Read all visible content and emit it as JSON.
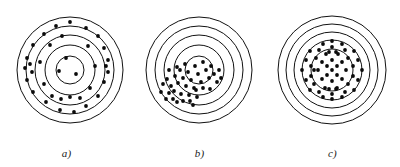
{
  "figure": {
    "background_color": "#ffffff",
    "ink_color": "#111111",
    "shot_color": "#0a0a0a",
    "panel_count": 3
  },
  "chart_data": {
    "type": "scatter",
    "title": "",
    "xlabel": "",
    "ylabel": "",
    "panels": [
      {
        "caption": "a)",
        "center": [
          70,
          70
        ],
        "ring_radii": [
          53,
          44,
          35,
          25,
          14
        ],
        "ring_count": 5,
        "pattern": "scattered",
        "shot_radius": 1.9,
        "shot_count": 36,
        "shots": [
          [
            70,
            22
          ],
          [
            56,
            26
          ],
          [
            86,
            28
          ],
          [
            44,
            34
          ],
          [
            98,
            36
          ],
          [
            33,
            45
          ],
          [
            104,
            48
          ],
          [
            27,
            58
          ],
          [
            108,
            60
          ],
          [
            25,
            68
          ],
          [
            108,
            72
          ],
          [
            27,
            80
          ],
          [
            104,
            82
          ],
          [
            33,
            92
          ],
          [
            98,
            96
          ],
          [
            46,
            102
          ],
          [
            86,
            106
          ],
          [
            60,
            110
          ],
          [
            74,
            112
          ],
          [
            50,
            45
          ],
          [
            88,
            46
          ],
          [
            40,
            62
          ],
          [
            95,
            66
          ],
          [
            44,
            84
          ],
          [
            90,
            88
          ],
          [
            62,
            36
          ],
          [
            80,
            98
          ],
          [
            66,
            58
          ],
          [
            76,
            74
          ],
          [
            59,
            71
          ],
          [
            30,
            64
          ],
          [
            32,
            72
          ],
          [
            106,
            66
          ],
          [
            52,
            96
          ],
          [
            61,
            99
          ],
          [
            70,
            97
          ]
        ]
      },
      {
        "caption": "b)",
        "center": [
          66,
          70
        ],
        "ring_radii": [
          53,
          44,
          35,
          25,
          14
        ],
        "ring_count": 5,
        "pattern": "clustered-low-left",
        "shot_radius": 1.9,
        "shot_count": 40,
        "shots": [
          [
            30,
            84
          ],
          [
            34,
            79
          ],
          [
            38,
            86
          ],
          [
            28,
            92
          ],
          [
            36,
            93
          ],
          [
            42,
            76
          ],
          [
            45,
            83
          ],
          [
            41,
            91
          ],
          [
            33,
            99
          ],
          [
            40,
            99
          ],
          [
            47,
            70
          ],
          [
            50,
            78
          ],
          [
            53,
            86
          ],
          [
            48,
            94
          ],
          [
            44,
            102
          ],
          [
            55,
            72
          ],
          [
            58,
            80
          ],
          [
            61,
            88
          ],
          [
            56,
            95
          ],
          [
            50,
            101
          ],
          [
            62,
            66
          ],
          [
            65,
            74
          ],
          [
            68,
            82
          ],
          [
            63,
            90
          ],
          [
            57,
            101
          ],
          [
            70,
            62
          ],
          [
            73,
            70
          ],
          [
            76,
            78
          ],
          [
            70,
            88
          ],
          [
            64,
            97
          ],
          [
            78,
            66
          ],
          [
            81,
            74
          ],
          [
            84,
            82
          ],
          [
            77,
            89
          ],
          [
            86,
            70
          ],
          [
            88,
            78
          ],
          [
            36,
            70
          ],
          [
            44,
            67
          ],
          [
            52,
            64
          ],
          [
            60,
            105
          ]
        ]
      },
      {
        "caption": "c)",
        "center": [
          66,
          70
        ],
        "ring_radii": [
          54,
          46,
          38,
          30,
          21
        ],
        "ring_count": 5,
        "pattern": "clustered-center",
        "shot_radius": 1.9,
        "shot_count": 52,
        "shots": [
          [
            66,
            70
          ],
          [
            61,
            66
          ],
          [
            71,
            66
          ],
          [
            61,
            75
          ],
          [
            71,
            75
          ],
          [
            56,
            62
          ],
          [
            66,
            60
          ],
          [
            76,
            62
          ],
          [
            56,
            79
          ],
          [
            66,
            81
          ],
          [
            76,
            79
          ],
          [
            52,
            70
          ],
          [
            80,
            70
          ],
          [
            50,
            58
          ],
          [
            60,
            54
          ],
          [
            72,
            54
          ],
          [
            82,
            58
          ],
          [
            48,
            84
          ],
          [
            59,
            88
          ],
          [
            71,
            88
          ],
          [
            82,
            84
          ],
          [
            45,
            66
          ],
          [
            45,
            76
          ],
          [
            87,
            66
          ],
          [
            87,
            76
          ],
          [
            53,
            50
          ],
          [
            66,
            47
          ],
          [
            79,
            50
          ],
          [
            53,
            92
          ],
          [
            66,
            94
          ],
          [
            79,
            92
          ],
          [
            40,
            60
          ],
          [
            40,
            80
          ],
          [
            92,
            60
          ],
          [
            92,
            80
          ],
          [
            44,
            51
          ],
          [
            66,
            41
          ],
          [
            88,
            51
          ],
          [
            44,
            90
          ],
          [
            66,
            99
          ],
          [
            88,
            90
          ],
          [
            36,
            70
          ],
          [
            96,
            70
          ],
          [
            57,
            44
          ],
          [
            76,
            44
          ],
          [
            57,
            97
          ],
          [
            76,
            97
          ],
          [
            63,
            52
          ],
          [
            70,
            52
          ],
          [
            63,
            89
          ],
          [
            70,
            89
          ],
          [
            48,
            70
          ]
        ]
      }
    ]
  }
}
